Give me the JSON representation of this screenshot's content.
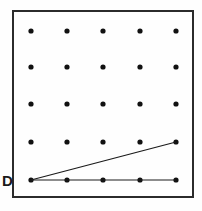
{
  "figure": {
    "name": "geoboard-diagram",
    "caption_label": "D",
    "background_color": "#fefefe",
    "ink_color": "#1a1a1a",
    "border": {
      "label": "board-frame",
      "x": 13,
      "y": 11,
      "width": 180,
      "height": 186,
      "stroke_width": 2,
      "color": "#2b2b2b"
    },
    "grid": {
      "label": "peg-grid",
      "rows": 5,
      "columns": 5,
      "x_positions": [
        31,
        67,
        103,
        140,
        176
      ],
      "y_positions": [
        31,
        67,
        104,
        142,
        180
      ],
      "dot_radius": 2.6,
      "dot_color": "#111111"
    },
    "segments": [
      {
        "label": "diagonal-segment",
        "x1": 31,
        "y1": 180,
        "x2": 176,
        "y2": 142,
        "stroke_width": 1.2,
        "color": "#1a1a1a"
      },
      {
        "label": "horizontal-segment",
        "x1": 31,
        "y1": 180,
        "x2": 176,
        "y2": 180,
        "stroke_width": 1.2,
        "color": "#1a1a1a"
      }
    ],
    "label_position": {
      "x": 2,
      "y": 186
    }
  }
}
